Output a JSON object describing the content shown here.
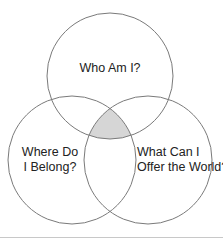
{
  "diagram": {
    "type": "venn",
    "colors": {
      "background": "#ffffff",
      "stroke": "#7a7a7a",
      "intersection_fill": "#d6d6d6",
      "text": "#222222",
      "bottom_rule": "#c8c8c8"
    },
    "circles": [
      {
        "id": "top",
        "cx": 110,
        "cy": 76,
        "r": 63
      },
      {
        "id": "left",
        "cx": 72,
        "cy": 160,
        "r": 64
      },
      {
        "id": "right",
        "cx": 148,
        "cy": 160,
        "r": 64
      }
    ],
    "labels": {
      "top": {
        "lines": [
          "Who Am I?"
        ]
      },
      "left": {
        "lines": [
          "Where Do",
          "I Belong?"
        ]
      },
      "right": {
        "lines": [
          "What Can I",
          "Offer the World?"
        ]
      }
    },
    "intersection": {
      "shaded": true,
      "description": "center region common to all three circles"
    }
  }
}
